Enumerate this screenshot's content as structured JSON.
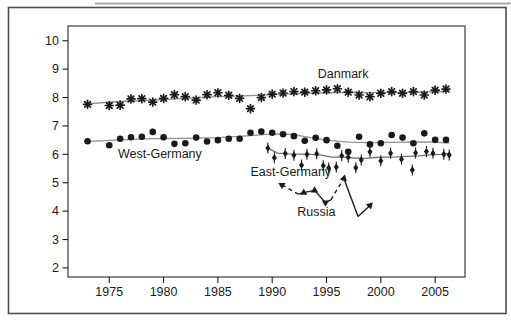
{
  "figure": {
    "background": "#ffffff",
    "frame_color": "#4d4d4d",
    "top_line_color": "#a8a8a8",
    "ink_color": "#1a1a1a",
    "plot_border_color": "#3c3c3c"
  },
  "chart_data": {
    "type": "scatter",
    "title": "",
    "xlabel": "",
    "ylabel": "",
    "grid": false,
    "x_axis": {
      "lim": [
        1971.2,
        2007.75
      ],
      "ticks": [
        1975,
        1980,
        1985,
        1990,
        1995,
        2000,
        2005
      ]
    },
    "y_axis": {
      "lim": [
        1.68,
        10.52
      ],
      "ticks": [
        2,
        3,
        4,
        5,
        6,
        7,
        8,
        9,
        10
      ]
    },
    "series": [
      {
        "id": "danmark",
        "label": "Danmark",
        "marker": "asterisk",
        "marker_color": "#1a1a1a",
        "trend_color": "#8f8f8f",
        "label_pos": [
          1994.2,
          8.69
        ],
        "points": [
          [
            1973,
            7.76
          ],
          [
            1975,
            7.72
          ],
          [
            1976,
            7.73
          ],
          [
            1977,
            7.95
          ],
          [
            1978,
            7.96
          ],
          [
            1979,
            7.84
          ],
          [
            1980,
            7.97
          ],
          [
            1981,
            8.1
          ],
          [
            1982,
            8.03
          ],
          [
            1983,
            7.91
          ],
          [
            1984,
            8.1
          ],
          [
            1985,
            8.17
          ],
          [
            1986,
            8.08
          ],
          [
            1987,
            7.97
          ],
          [
            1988,
            7.61
          ],
          [
            1989,
            8.0
          ],
          [
            1990,
            8.12
          ],
          [
            1991,
            8.16
          ],
          [
            1992,
            8.21
          ],
          [
            1993,
            8.19
          ],
          [
            1994,
            8.24
          ],
          [
            1995,
            8.27
          ],
          [
            1996,
            8.31
          ],
          [
            1997,
            8.19
          ],
          [
            1998,
            8.09
          ],
          [
            1999,
            8.03
          ],
          [
            2000,
            8.15
          ],
          [
            2001,
            8.21
          ],
          [
            2002,
            8.15
          ],
          [
            2003,
            8.21
          ],
          [
            2004,
            8.09
          ],
          [
            2005,
            8.26
          ],
          [
            2006,
            8.3
          ]
        ],
        "trend": [
          [
            1972.8,
            7.78
          ],
          [
            1976,
            7.86
          ],
          [
            1979,
            7.91
          ],
          [
            1982,
            7.97
          ],
          [
            1985,
            8.03
          ],
          [
            1988,
            8.07
          ],
          [
            1991,
            8.12
          ],
          [
            1994,
            8.16
          ],
          [
            1997,
            8.18
          ],
          [
            2000,
            8.17
          ],
          [
            2003,
            8.18
          ],
          [
            2006.3,
            8.22
          ]
        ]
      },
      {
        "id": "west-germany",
        "label": "West-Germany",
        "marker": "circle",
        "marker_color": "#1a1a1a",
        "trend_color": "#8f8f8f",
        "label_pos": [
          1975.8,
          5.87
        ],
        "points": [
          [
            1973,
            6.46
          ],
          [
            1975,
            6.32
          ],
          [
            1976,
            6.55
          ],
          [
            1977,
            6.6
          ],
          [
            1978,
            6.62
          ],
          [
            1979,
            6.79
          ],
          [
            1980,
            6.6
          ],
          [
            1981,
            6.37
          ],
          [
            1982,
            6.39
          ],
          [
            1983,
            6.59
          ],
          [
            1984,
            6.45
          ],
          [
            1985,
            6.5
          ],
          [
            1986,
            6.55
          ],
          [
            1987,
            6.55
          ],
          [
            1988,
            6.76
          ],
          [
            1989,
            6.8
          ],
          [
            1990,
            6.76
          ],
          [
            1991,
            6.71
          ],
          [
            1992,
            6.64
          ],
          [
            1993,
            6.48
          ],
          [
            1994,
            6.58
          ],
          [
            1995,
            6.5
          ],
          [
            1996,
            6.3
          ],
          [
            1997,
            6.09
          ],
          [
            1998,
            6.62
          ],
          [
            1999,
            6.35
          ],
          [
            2000,
            6.39
          ],
          [
            2001,
            6.68
          ],
          [
            2002,
            6.59
          ],
          [
            2003,
            6.39
          ],
          [
            2004,
            6.74
          ],
          [
            2005,
            6.51
          ],
          [
            2006,
            6.51
          ]
        ],
        "trend": [
          [
            1972.8,
            6.45
          ],
          [
            1976,
            6.51
          ],
          [
            1979,
            6.55
          ],
          [
            1982,
            6.56
          ],
          [
            1985,
            6.59
          ],
          [
            1988,
            6.66
          ],
          [
            1990,
            6.72
          ],
          [
            1992,
            6.7
          ],
          [
            1993,
            6.62
          ],
          [
            1995,
            6.5
          ],
          [
            1997,
            6.43
          ],
          [
            1999,
            6.41
          ],
          [
            2001,
            6.42
          ],
          [
            2003,
            6.44
          ],
          [
            2005,
            6.43
          ],
          [
            2006.3,
            6.4
          ]
        ]
      },
      {
        "id": "east-germany",
        "label": "East-Germany",
        "marker": "diamond-spike",
        "marker_color": "#1a1a1a",
        "trend_color": "#6f6f6f",
        "label_pos": [
          1988.0,
          5.24
        ],
        "points": [
          [
            1989.6,
            6.22
          ],
          [
            1990.2,
            5.88
          ],
          [
            1991.2,
            6.03
          ],
          [
            1992,
            5.97
          ],
          [
            1992.7,
            5.62
          ],
          [
            1993.2,
            6.0
          ],
          [
            1994.1,
            6.02
          ],
          [
            1994.7,
            5.6
          ],
          [
            1995.2,
            5.52
          ],
          [
            1995.9,
            5.55
          ],
          [
            1996.4,
            5.95
          ],
          [
            1997,
            5.9
          ],
          [
            1997.7,
            5.53
          ],
          [
            1998.2,
            5.8
          ],
          [
            1999,
            6.09
          ],
          [
            2000,
            5.77
          ],
          [
            2000.9,
            6.04
          ],
          [
            2001.9,
            5.83
          ],
          [
            2002.9,
            5.45
          ],
          [
            2003.2,
            6.05
          ],
          [
            2004.2,
            6.1
          ],
          [
            2004.8,
            6.04
          ],
          [
            2005.8,
            6.0
          ],
          [
            2006.3,
            5.98
          ]
        ],
        "trend": [
          [
            1989.6,
            6.22
          ],
          [
            1990.5,
            6.04
          ],
          [
            1991.5,
            6.02
          ],
          [
            1992.5,
            6.01
          ],
          [
            1993.5,
            6.0
          ],
          [
            1994.5,
            5.97
          ],
          [
            1995.5,
            5.9
          ],
          [
            1996.5,
            5.9
          ],
          [
            1997.5,
            5.87
          ],
          [
            1998.5,
            5.86
          ],
          [
            1999.5,
            5.89
          ],
          [
            2000.5,
            5.9
          ],
          [
            2001.5,
            5.91
          ],
          [
            2002.5,
            5.93
          ],
          [
            2003.5,
            5.95
          ],
          [
            2004.5,
            5.98
          ],
          [
            2005.5,
            6.0
          ],
          [
            2006.3,
            6.03
          ]
        ]
      },
      {
        "id": "russia",
        "label": "Russia",
        "marker": "triangle",
        "marker_color": "#1a1a1a",
        "line_color": "#1a1a1a",
        "label_pos": [
          1992.3,
          3.82
        ],
        "points": [
          [
            1990.9,
            4.92,
            "tri-down"
          ],
          [
            1992.4,
            4.6,
            null
          ],
          [
            1992.9,
            4.65,
            "tri-up"
          ],
          [
            1993.9,
            4.73,
            "tri-up"
          ],
          [
            1994.9,
            4.3,
            "tri-down"
          ],
          [
            1995.4,
            4.4,
            null
          ],
          [
            1996.6,
            5.15,
            "arrow-se"
          ],
          [
            1997.9,
            3.81,
            null
          ],
          [
            1999.0,
            4.2,
            "arrow-ne"
          ]
        ],
        "segment_styles": [
          "dashed",
          "solid",
          "solid",
          "solid",
          "solid",
          "dashed",
          "solid",
          "solid"
        ]
      }
    ]
  }
}
